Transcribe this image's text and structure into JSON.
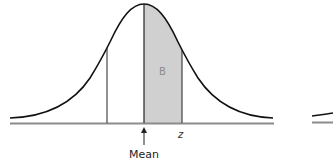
{
  "diagram": {
    "type": "normal-distribution-curve",
    "regions": [
      {
        "label": "B",
        "from": "mean",
        "to": "z",
        "fill": "#d0d0d0"
      }
    ],
    "markers": {
      "mean_label": "Mean",
      "z_label": "z",
      "region_label": "B"
    },
    "colors": {
      "curve": "#111111",
      "baseline": "#8c8c8c",
      "shade": "#d0d0d0"
    }
  }
}
